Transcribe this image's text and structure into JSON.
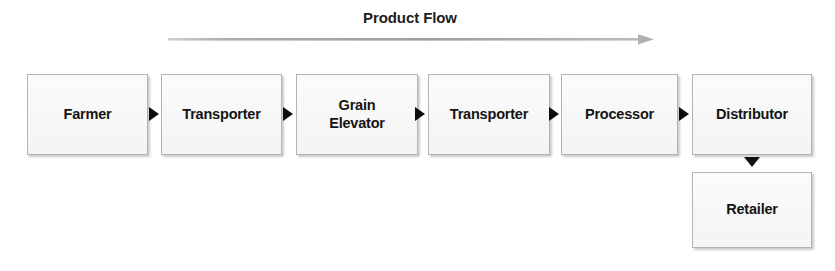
{
  "diagram": {
    "title": "Product Flow",
    "flow_arrow": {
      "icon": "long-right-arrow-icon",
      "color": "#a8a8a8",
      "direction": "right"
    },
    "nodes": [
      {
        "id": "farmer",
        "label": "Farmer",
        "line1": "Farmer",
        "line2": ""
      },
      {
        "id": "transporter-1",
        "label": "Transporter",
        "line1": "Transporter",
        "line2": ""
      },
      {
        "id": "grain-elevator",
        "label": "Grain Elevator",
        "line1": "Grain",
        "line2": "Elevator"
      },
      {
        "id": "transporter-2",
        "label": "Transporter",
        "line1": "Transporter",
        "line2": ""
      },
      {
        "id": "processor",
        "label": "Processor",
        "line1": "Processor",
        "line2": ""
      },
      {
        "id": "distributor",
        "label": "Distributor",
        "line1": "Distributor",
        "line2": ""
      },
      {
        "id": "retailer",
        "label": "Retailer",
        "line1": "Retailer",
        "line2": ""
      }
    ],
    "connectors": [
      {
        "id": "farmer-to-transporter-1",
        "from": "farmer",
        "to": "transporter-1",
        "icon": "right-triangle-arrow-icon"
      },
      {
        "id": "transporter-1-to-grain-elevator",
        "from": "transporter-1",
        "to": "grain-elevator",
        "icon": "right-triangle-arrow-icon"
      },
      {
        "id": "grain-elevator-to-transporter-2",
        "from": "grain-elevator",
        "to": "transporter-2",
        "icon": "right-triangle-arrow-icon"
      },
      {
        "id": "transporter-2-to-processor",
        "from": "transporter-2",
        "to": "processor",
        "icon": "right-triangle-arrow-icon"
      },
      {
        "id": "processor-to-distributor",
        "from": "processor",
        "to": "distributor",
        "icon": "right-triangle-arrow-icon"
      },
      {
        "id": "distributor-to-retailer",
        "from": "distributor",
        "to": "retailer",
        "icon": "down-triangle-arrow-icon"
      }
    ],
    "colors": {
      "node_fill": "#f8f8f8",
      "node_border": "#b3b3b3",
      "text": "#141414",
      "arrow": "#0d0d0d",
      "flow_arrow": "#a8a8a8",
      "background": "#ffffff"
    }
  }
}
